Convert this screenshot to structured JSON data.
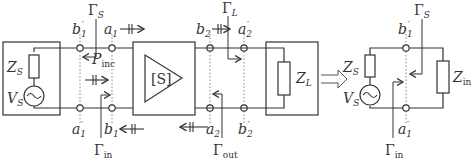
{
  "diagram": {
    "left_circuit": {
      "source_impedance": "Z",
      "source_impedance_sub": "S",
      "source_voltage": "V",
      "source_voltage_sub": "S",
      "two_port": "[S]",
      "load_impedance": "Z",
      "load_impedance_sub": "L",
      "port_labels": {
        "b1p_top": "b",
        "b1p_top_sub": "1",
        "b1p_top_prime": "′",
        "a1p_bot": "a",
        "a1p_bot_sub": "1",
        "a1p_bot_prime": "′",
        "a1_top": "a",
        "a1_top_sub": "1",
        "b1_bot": "b",
        "b1_bot_sub": "1",
        "b2_top": "b",
        "b2_top_sub": "2",
        "a2_bot": "a",
        "a2_bot_sub": "2",
        "a2p_top": "a",
        "a2p_top_sub": "2",
        "a2p_top_prime": "′",
        "b2p_bot": "b",
        "b2p_bot_sub": "2",
        "b2p_bot_prime": "′"
      },
      "reflection_labels": {
        "gamma_s": "Γ",
        "gamma_s_sub": "S",
        "gamma_in": "Γ",
        "gamma_in_sub": "in",
        "gamma_l": "Γ",
        "gamma_l_sub": "L",
        "gamma_out": "Γ",
        "gamma_out_sub": "out"
      },
      "power_label": "P",
      "power_label_sub": "inc"
    },
    "equivalence_arrow": "⇒",
    "right_circuit": {
      "source_impedance": "Z",
      "source_impedance_sub": "S",
      "source_voltage": "V",
      "source_voltage_sub": "S",
      "input_impedance": "Z",
      "input_impedance_sub": "in",
      "b1p_top": "b",
      "b1p_top_sub": "1",
      "b1p_top_prime": "′",
      "a1p_bot": "a",
      "a1p_bot_sub": "1",
      "a1p_bot_prime": "′",
      "gamma_s": "Γ",
      "gamma_s_sub": "S",
      "gamma_in": "Γ",
      "gamma_in_sub": "in"
    },
    "colors": {
      "stroke": "#333333",
      "dotted": "#888888",
      "background": "#ffffff"
    }
  }
}
